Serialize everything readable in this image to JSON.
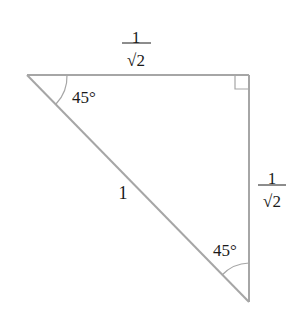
{
  "diagram": {
    "type": "right-triangle",
    "line_color": "#a6a6a6",
    "text_color": "#1a1a1a",
    "vertices": {
      "top_left": [
        27,
        75
      ],
      "top_right": [
        249,
        75
      ],
      "bottom_right": [
        249,
        302
      ]
    },
    "labels": {
      "top_side_numerator": "1",
      "top_side_denominator": "√2",
      "right_side_numerator": "1",
      "right_side_denominator": "√2",
      "hypotenuse": "1",
      "angle_top_left": "45°",
      "angle_bottom": "45°"
    },
    "right_angle_marker": "top_right"
  }
}
